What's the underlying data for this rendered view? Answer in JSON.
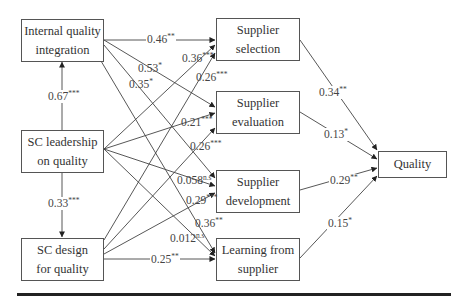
{
  "nodes": {
    "iqi": {
      "line1": "Internal quality",
      "line2": "integration"
    },
    "scl": {
      "line1": "SC leadership",
      "line2": "on quality"
    },
    "scd": {
      "line1": "SC design",
      "line2": "for quality"
    },
    "ss": {
      "line1": "Supplier",
      "line2": "selection"
    },
    "se": {
      "line1": "Supplier",
      "line2": "evaluation"
    },
    "sd": {
      "line1": "Supplier",
      "line2": "development"
    },
    "lfs": {
      "line1": "Learning from",
      "line2": "supplier"
    },
    "q": {
      "line1": "Quality"
    }
  },
  "edges": [
    {
      "id": "scl_iqi",
      "from": "SC leadership on quality",
      "to": "Internal quality integration",
      "coef": "0.67",
      "sig": "***"
    },
    {
      "id": "scl_scd",
      "from": "SC leadership on quality",
      "to": "SC design for quality",
      "coef": "0.33",
      "sig": "***"
    },
    {
      "id": "iqi_ss",
      "from": "Internal quality integration",
      "to": "Supplier selection",
      "coef": "0.46",
      "sig": "**"
    },
    {
      "id": "iqi_se",
      "from": "Internal quality integration",
      "to": "Supplier evaluation",
      "coef": "0.53",
      "sig": "*"
    },
    {
      "id": "iqi_sd",
      "from": "Internal quality integration",
      "to": "Supplier development",
      "coef": "0.35",
      "sig": "*"
    },
    {
      "id": "scl_ss",
      "from": "SC leadership on quality",
      "to": "Supplier selection",
      "coef": "0.36",
      "sig": "***"
    },
    {
      "id": "scd_ss",
      "from": "SC design for quality",
      "to": "Supplier selection",
      "coef": "0.26",
      "sig": "***"
    },
    {
      "id": "scl_se",
      "from": "SC leadership on quality",
      "to": "Supplier evaluation",
      "coef": "0.21",
      "sig": "***"
    },
    {
      "id": "scd_se",
      "from": "SC design for quality",
      "to": "Supplier evaluation",
      "coef": "0.26",
      "sig": "***"
    },
    {
      "id": "scl_sd",
      "from": "SC leadership on quality",
      "to": "Supplier development",
      "coef": "0.058",
      "sig": "n.s"
    },
    {
      "id": "scd_sd",
      "from": "SC design for quality",
      "to": "Supplier development",
      "coef": "0.29",
      "sig": "***"
    },
    {
      "id": "iqi_lfs",
      "from": "Internal quality integration",
      "to": "Learning from supplier",
      "coef": "0.36",
      "sig": "**"
    },
    {
      "id": "scl_lfs",
      "from": "SC leadership on quality",
      "to": "Learning from supplier",
      "coef": "0.012",
      "sig": "n.s"
    },
    {
      "id": "scd_lfs",
      "from": "SC design for quality",
      "to": "Learning from supplier",
      "coef": "0.25",
      "sig": "**"
    },
    {
      "id": "ss_q",
      "from": "Supplier selection",
      "to": "Quality",
      "coef": "0.34",
      "sig": "**"
    },
    {
      "id": "se_q",
      "from": "Supplier evaluation",
      "to": "Quality",
      "coef": "0.13",
      "sig": "*"
    },
    {
      "id": "sd_q",
      "from": "Supplier development",
      "to": "Quality",
      "coef": "0.29",
      "sig": "**"
    },
    {
      "id": "lfs_q",
      "from": "Learning from supplier",
      "to": "Quality",
      "coef": "0.15",
      "sig": "*"
    }
  ],
  "colors": {
    "line": "#444444",
    "box_border": "#555555",
    "text": "#333333",
    "rule": "#222222"
  }
}
